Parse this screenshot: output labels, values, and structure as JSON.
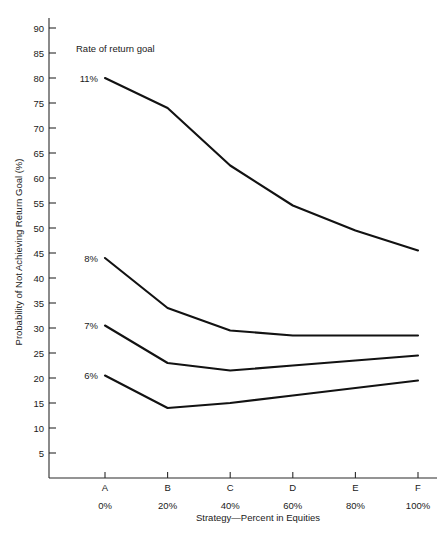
{
  "chart_data": {
    "type": "line",
    "title": "",
    "annotation": "Rate of return goal",
    "xlabel": "Strategy—Percent in Equities",
    "ylabel": "Probability of Not Achieving Return Goal (%)",
    "categories": [
      "A",
      "B",
      "C",
      "D",
      "E",
      "F"
    ],
    "category_sublabels": [
      "0%",
      "20%",
      "40%",
      "60%",
      "80%",
      "100%"
    ],
    "ylim": [
      0,
      92
    ],
    "ytick_values": [
      5,
      10,
      15,
      20,
      25,
      30,
      35,
      40,
      45,
      50,
      55,
      60,
      65,
      70,
      75,
      80,
      85,
      90
    ],
    "ytick_labels": [
      "5",
      "10",
      "15",
      "20",
      "25",
      "30",
      "35",
      "40",
      "45",
      "50",
      "55",
      "60",
      "65",
      "70",
      "75",
      "80",
      "85",
      "90"
    ],
    "grid": false,
    "legend_position": "inline-left-of-series",
    "series": [
      {
        "name": "11%",
        "label": "11%",
        "values": [
          80,
          74,
          62.5,
          54.5,
          49.5,
          45.5
        ]
      },
      {
        "name": "8%",
        "label": "8%",
        "values": [
          44,
          34,
          29.5,
          28.5,
          28.5,
          28.5
        ]
      },
      {
        "name": "7%",
        "label": "7%",
        "values": [
          30.5,
          23,
          21.5,
          22.5,
          23.5,
          24.5
        ]
      },
      {
        "name": "6%",
        "label": "6%",
        "values": [
          20.5,
          14,
          15,
          16.5,
          18,
          19.5
        ]
      }
    ]
  }
}
